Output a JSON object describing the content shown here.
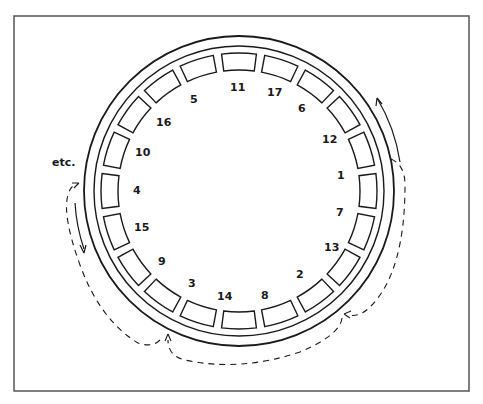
{
  "diagram": {
    "frame": {
      "x": 14,
      "y": 16,
      "width": 455,
      "height": 375,
      "stroke": "#555555"
    },
    "wheel": {
      "center": [
        239,
        191
      ],
      "outer_radius": 155,
      "inner_ring_radius": 145,
      "slot_inner_radius": 121,
      "slot_outer_radius": 138,
      "slot_count": 20,
      "slot_start_angle_deg": -99,
      "slot_gap_deg": 3.5,
      "line_color": "#1a1a1a"
    },
    "labels": [
      {
        "text": "11",
        "x": 230,
        "y": 91
      },
      {
        "text": "17",
        "x": 267,
        "y": 96
      },
      {
        "text": "6",
        "x": 298,
        "y": 112
      },
      {
        "text": "12",
        "x": 322,
        "y": 143
      },
      {
        "text": "1",
        "x": 337,
        "y": 179
      },
      {
        "text": "7",
        "x": 336,
        "y": 216
      },
      {
        "text": "13",
        "x": 324,
        "y": 251
      },
      {
        "text": "2",
        "x": 296,
        "y": 278
      },
      {
        "text": "8",
        "x": 261,
        "y": 299
      },
      {
        "text": "14",
        "x": 217,
        "y": 300
      },
      {
        "text": "3",
        "x": 188,
        "y": 287
      },
      {
        "text": "9",
        "x": 158,
        "y": 265
      },
      {
        "text": "15",
        "x": 134,
        "y": 231
      },
      {
        "text": "4",
        "x": 133,
        "y": 194
      },
      {
        "text": "10",
        "x": 135,
        "y": 156
      },
      {
        "text": "16",
        "x": 156,
        "y": 126
      },
      {
        "text": "5",
        "x": 190,
        "y": 103
      }
    ],
    "etc_label": {
      "text": "etc.",
      "x": 52,
      "y": 166
    }
  }
}
